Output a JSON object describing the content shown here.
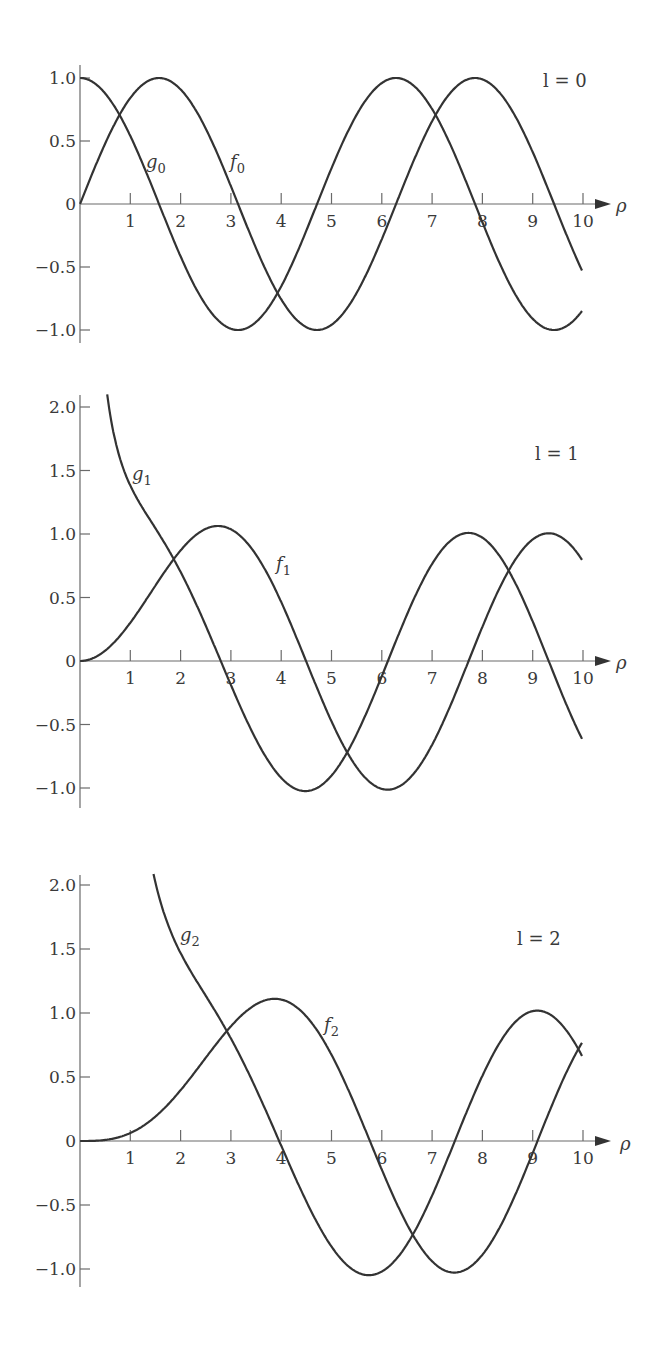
{
  "figure": {
    "axis_color": "#6a6a6a",
    "curve_color": "#333333",
    "background": "#ffffff"
  },
  "chart_data": [
    {
      "type": "line",
      "title": "l = 0",
      "annotation": "l = 0",
      "xlabel": "ρ",
      "ylabel": "",
      "xlim": [
        0,
        10
      ],
      "ylim": [
        -1.0,
        1.0
      ],
      "xticks": [
        "1",
        "2",
        "3",
        "4",
        "5",
        "6",
        "7",
        "8",
        "9",
        "10"
      ],
      "yticks": [
        "1.0",
        "0.5",
        "0",
        "−0.5",
        "−1.0"
      ],
      "ytick_values": [
        1.0,
        0.5,
        0,
        -0.5,
        -1.0
      ],
      "grid": false,
      "legend": "inline curve labels",
      "x": [
        0,
        0.5,
        1,
        1.5,
        2,
        2.5,
        3,
        3.5,
        4,
        4.5,
        5,
        5.5,
        6,
        6.5,
        7,
        7.5,
        8,
        8.5,
        9,
        9.5,
        10
      ],
      "series": [
        {
          "name": "g0",
          "label": "g",
          "sub": "0",
          "kind": "g",
          "l": 0,
          "values": [
            1.0,
            0.88,
            0.54,
            0.07,
            -0.42,
            -0.8,
            -0.99,
            -0.94,
            -0.65,
            -0.21,
            0.28,
            0.71,
            0.96,
            0.98,
            0.75,
            0.35,
            -0.15,
            -0.6,
            -0.91,
            -1.0,
            -0.84
          ]
        },
        {
          "name": "f0",
          "label": "f",
          "sub": "0",
          "kind": "f",
          "l": 0,
          "values": [
            0.0,
            0.48,
            0.84,
            1.0,
            0.91,
            0.6,
            0.14,
            -0.35,
            -0.76,
            -0.98,
            -0.96,
            -0.71,
            -0.28,
            0.22,
            0.66,
            0.94,
            0.99,
            0.8,
            0.41,
            -0.08,
            -0.54
          ]
        }
      ]
    },
    {
      "type": "line",
      "title": "l = 1",
      "annotation": "l = 1",
      "xlabel": "ρ",
      "ylabel": "",
      "xlim": [
        0,
        10
      ],
      "ylim": [
        -1.0,
        2.0
      ],
      "xticks": [
        "1",
        "2",
        "3",
        "4",
        "5",
        "6",
        "7",
        "8",
        "9",
        "10"
      ],
      "yticks": [
        "2.0",
        "1.5",
        "1.0",
        "0.5",
        "0",
        "−0.5",
        "−1.0"
      ],
      "ytick_values": [
        2.0,
        1.5,
        1.0,
        0.5,
        0,
        -0.5,
        -1.0
      ],
      "grid": false,
      "legend": "inline curve labels",
      "x": [
        0.56,
        1,
        1.5,
        2,
        2.5,
        3,
        3.5,
        4,
        4.5,
        5,
        5.5,
        6,
        6.5,
        7,
        7.5,
        8,
        8.5,
        9,
        9.5,
        10
      ],
      "series": [
        {
          "name": "g1",
          "label": "g",
          "sub": "1",
          "kind": "g",
          "l": 1,
          "values": [
            2.09,
            1.38,
            1.04,
            0.7,
            0.28,
            -0.19,
            -0.62,
            -0.92,
            -1.02,
            -0.88,
            -0.53,
            -0.09,
            0.37,
            0.78,
            0.99,
            0.97,
            0.72,
            0.31,
            -0.17,
            -0.59
          ]
        },
        {
          "name": "f1",
          "label": "f",
          "sub": "1",
          "kind": "f",
          "l": 1,
          "values": [
            0.1,
            0.3,
            0.6,
            0.87,
            1.04,
            1.03,
            0.82,
            0.46,
            0.0,
            -0.47,
            -0.86,
            -1.01,
            -0.92,
            -0.62,
            -0.18,
            0.3,
            0.71,
            0.96,
            0.99,
            0.79
          ]
        }
      ]
    },
    {
      "type": "line",
      "title": "l = 2",
      "annotation": "l = 2",
      "xlabel": "ρ",
      "ylabel": "",
      "xlim": [
        0,
        10
      ],
      "ylim": [
        -1.0,
        2.0
      ],
      "xticks": [
        "1",
        "2",
        "3",
        "4",
        "5",
        "6",
        "7",
        "8",
        "9",
        "10"
      ],
      "yticks": [
        "2.0",
        "1.5",
        "1.0",
        "0.5",
        "0",
        "−0.5",
        "−1.0"
      ],
      "ytick_values": [
        2.0,
        1.5,
        1.0,
        0.5,
        0,
        -0.5,
        -1.0
      ],
      "grid": false,
      "legend": "inline curve labels",
      "x": [
        0,
        0.5,
        1,
        1.5,
        2,
        2.5,
        3,
        3.5,
        4,
        4.5,
        5,
        5.5,
        6,
        6.5,
        7,
        7.5,
        8,
        8.5,
        9,
        9.5,
        10
      ],
      "series": [
        {
          "name": "g2",
          "label": "g",
          "sub": "2",
          "kind": "g",
          "l": 2,
          "values": [
            null,
            null,
            null,
            2.06,
            1.53,
            1.14,
            0.69,
            0.21,
            -0.26,
            -0.69,
            -0.97,
            -1.03,
            -0.81,
            -0.41,
            0.06,
            0.52,
            0.87,
            1.01,
            0.93,
            0.64,
            0.2
          ]
        },
        {
          "name": "f2",
          "label": "f",
          "sub": "2",
          "kind": "f",
          "l": 2,
          "values": [
            0.0,
            0.01,
            0.06,
            0.2,
            0.4,
            0.65,
            0.88,
            1.04,
            1.1,
            0.99,
            0.73,
            0.32,
            -0.17,
            -0.62,
            -0.95,
            -1.04,
            -0.86,
            -0.48,
            0.01,
            0.5,
            0.85
          ]
        }
      ]
    }
  ],
  "panels": [
    {
      "l_label": "l = 0",
      "g_label": "g",
      "g_sub": "0",
      "f_label": "f",
      "f_sub": "0",
      "rho": "ρ"
    },
    {
      "l_label": "l = 1",
      "g_label": "g",
      "g_sub": "1",
      "f_label": "f",
      "f_sub": "1",
      "rho": "ρ"
    },
    {
      "l_label": "l = 2",
      "g_label": "g",
      "g_sub": "2",
      "f_label": "f",
      "f_sub": "2",
      "rho": "ρ"
    }
  ]
}
